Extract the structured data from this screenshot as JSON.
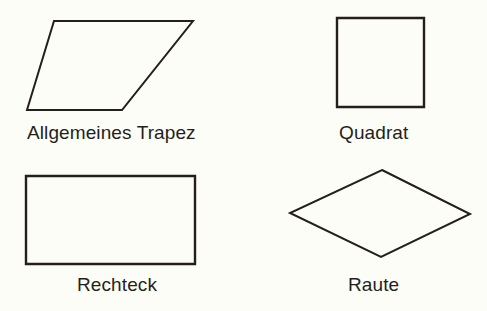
{
  "figure": {
    "background_color": "#fdfdf7",
    "stroke_color": "#241f1d",
    "text_color": "#241f1d",
    "stroke_width": 2
  },
  "shapes": [
    {
      "id": "parallelogram",
      "label": "Allgemeines Trapez",
      "icon_name": "parallelogram-shape",
      "type": "polygon",
      "points": "54,21 193,21 122,110 27,110",
      "vertices": [
        {
          "x": 54,
          "y": 21
        },
        {
          "x": 193,
          "y": 21
        },
        {
          "x": 122,
          "y": 110
        },
        {
          "x": 27,
          "y": 110
        }
      ]
    },
    {
      "id": "square",
      "label": "Quadrat",
      "icon_name": "square-shape",
      "type": "polygon",
      "points": "337,18 424,18 424,107 337,107",
      "vertices": [
        {
          "x": 337,
          "y": 18
        },
        {
          "x": 424,
          "y": 18
        },
        {
          "x": 424,
          "y": 107
        },
        {
          "x": 337,
          "y": 107
        }
      ]
    },
    {
      "id": "rectangle",
      "label": "Rechteck",
      "icon_name": "rectangle-shape",
      "type": "polygon",
      "points": "26,176 195,176 195,264 26,264",
      "vertices": [
        {
          "x": 26,
          "y": 176
        },
        {
          "x": 195,
          "y": 176
        },
        {
          "x": 195,
          "y": 264
        },
        {
          "x": 26,
          "y": 264
        }
      ]
    },
    {
      "id": "rhombus",
      "label": "Raute",
      "icon_name": "rhombus-shape",
      "type": "polygon",
      "points": "382,170 470,214 381,257 290,213",
      "vertices": [
        {
          "x": 382,
          "y": 170
        },
        {
          "x": 470,
          "y": 214
        },
        {
          "x": 381,
          "y": 257
        },
        {
          "x": 290,
          "y": 213
        }
      ]
    }
  ]
}
